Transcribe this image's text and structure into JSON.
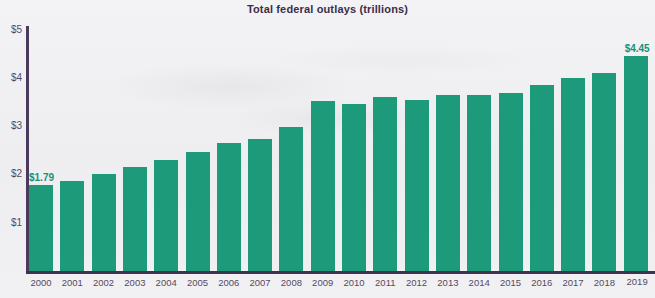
{
  "chart_data": {
    "type": "bar",
    "title": "Total federal outlays (trillions)",
    "xlabel": "",
    "ylabel": "",
    "ylim": [
      0,
      5
    ],
    "grid": false,
    "legend": "none",
    "y_tick_labels": [
      "$5",
      "$4",
      "$3",
      "$2",
      "$1"
    ],
    "y_tick_values": [
      5,
      4,
      3,
      2,
      1
    ],
    "categories": [
      "2000",
      "2001",
      "2002",
      "2003",
      "2004",
      "2005",
      "2006",
      "2007",
      "2008",
      "2009",
      "2010",
      "2011",
      "2012",
      "2013",
      "2014",
      "2015",
      "2016",
      "2017",
      "2018",
      "2019"
    ],
    "values": [
      1.79,
      1.86,
      2.01,
      2.16,
      2.29,
      2.47,
      2.66,
      2.73,
      2.98,
      3.52,
      3.46,
      3.6,
      3.54,
      3.65,
      3.65,
      3.69,
      3.85,
      3.99,
      4.11,
      4.45
    ],
    "annotations": [
      {
        "category": "2000",
        "text": "$1.79",
        "position": "above-bar"
      },
      {
        "category": "2019",
        "text": "$4.45",
        "position": "above-bar"
      }
    ],
    "colors": {
      "bar": "#1d9a79",
      "title": "#3b2e49",
      "axis": "#4b3a5a",
      "tick_label": "#57495f",
      "data_label": "#189077",
      "background": "#f0f0f3"
    }
  }
}
